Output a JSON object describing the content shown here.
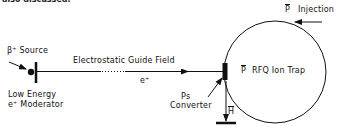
{
  "figure": {
    "top_cut_text": "also discussed.",
    "labels": {
      "beta_source": "β⁺ Source",
      "guide_field": "Electrostatic Guide Field",
      "positron": "e⁺",
      "moderator_line1": "Low Energy",
      "moderator_line2": "e⁺ Moderator",
      "ps_line1": "Ps",
      "ps_line2": "Converter",
      "antihydrogen": "H",
      "pbar_symbol": "P",
      "injection": "Injection",
      "trap_pbar": "P",
      "trap_name": "RFQ Ion Trap"
    },
    "colors": {
      "stroke": "#111111",
      "background": "#ffffff"
    }
  }
}
